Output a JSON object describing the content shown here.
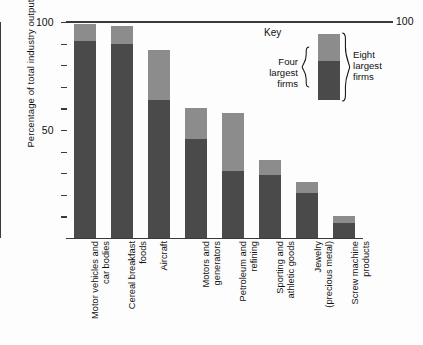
{
  "chart_data": {
    "type": "bar",
    "subtype": "stacked-bar",
    "title": "",
    "xlabel": "",
    "ylabel": "Percentage of total industry output",
    "ylim": [
      0,
      100
    ],
    "ytick_values": [
      0,
      10,
      20,
      30,
      40,
      50,
      60,
      70,
      80,
      90,
      100
    ],
    "ytick_labels_shown": [
      "50",
      "100"
    ],
    "right_axis_label": "100",
    "grid": false,
    "legend_position": "top-right",
    "categories": [
      "Motor vehicles and\ncar bodies",
      "Cereal breakfast\nfoods",
      "Aircraft",
      "Motors and\ngenerators",
      "Petroleum and\nrefining",
      "Sporting and\nathletic goods",
      "Jewelry\n(precious metal)",
      "Screw machine\nproducts"
    ],
    "series": [
      {
        "name": "Four largest firms",
        "color": "#4a4a4a",
        "values": [
          91,
          90,
          64,
          46,
          31,
          29,
          21,
          7
        ]
      },
      {
        "name": "Eight largest firms",
        "color": "#8c8c8c",
        "note": "cumulative total including the four largest firms",
        "values": [
          99,
          98,
          87,
          60,
          58,
          36,
          26,
          10
        ]
      }
    ],
    "legend": {
      "title": "Key",
      "entries": [
        {
          "label": "Four\nlargest\nfirms",
          "color": "#4a4a4a"
        },
        {
          "label": "Eight\nlargest\nfirms",
          "color": "#8c8c8c"
        }
      ]
    }
  },
  "axes": {
    "y_title": "Percentage of total industry output",
    "y_top_label": "100",
    "y_mid_label": "50",
    "right_top_label": "100"
  },
  "legend": {
    "title": "Key",
    "left_text": "Four\nlargest\nfirms",
    "right_text": "Eight\nlargest\nfirms"
  },
  "colors": {
    "dark": "#4a4a4a",
    "light": "#8c8c8c",
    "axis": "#3a3a3a",
    "text": "#111111",
    "background": "#fdfdfd"
  }
}
